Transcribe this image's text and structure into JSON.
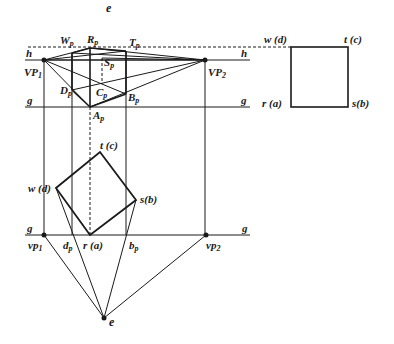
{
  "figure": {
    "type": "two-point perspective construction (plan method)",
    "colors": {
      "line": "#1a1a1a",
      "background": "#ffffff"
    }
  },
  "labels": {
    "e_top": "e",
    "h_upper": "h",
    "h_right": "h",
    "g_upper_left": "g",
    "g_upper_right": "g",
    "g_lower_left": "g",
    "g_lower_right": "g",
    "VP1": "VP",
    "VP1_sub": "1",
    "VP2": "VP",
    "VP2_sub": "2",
    "Wp": "W",
    "Wp_sub": "p",
    "Rp": "R",
    "Rp_sub": "p",
    "Tp": "T",
    "Tp_sub": "p",
    "Sp": "S",
    "Sp_sub": "p",
    "Dp": "D",
    "Dp_sub": "p",
    "Cp": "C",
    "Cp_sub": "p",
    "Bp": "B",
    "Bp_sub": "p",
    "Ap": "A",
    "Ap_sub": "p",
    "plan_t": "t (c)",
    "plan_w": "w (d)",
    "plan_s": "s(b)",
    "plan_r": "r (a)",
    "vp1": "vp",
    "vp1_sub": "1",
    "vp2": "vp",
    "vp2_sub": "2",
    "dp": "d",
    "dp_sub": "p",
    "bp": "b",
    "bp_sub": "p",
    "e_bottom": "e",
    "elev_w": "w (d)",
    "elev_t": "t (c)",
    "elev_r": "r (a)",
    "elev_s": "s(b)"
  }
}
